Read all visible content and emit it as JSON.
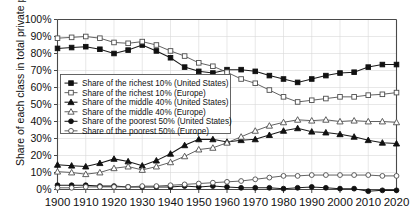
{
  "chart_data": {
    "type": "line",
    "title": "",
    "xlabel": "",
    "ylabel": "Share of each class in total private property",
    "xlim": [
      1900,
      2020
    ],
    "ylim": [
      0,
      1.0
    ],
    "ytick_labels": [
      "0%",
      "10%",
      "20%",
      "30%",
      "40%",
      "50%",
      "60%",
      "70%",
      "80%",
      "90%",
      "100%"
    ],
    "ytick_values": [
      0,
      10,
      20,
      30,
      40,
      50,
      60,
      70,
      80,
      90,
      100
    ],
    "xtick_labels": [
      "1900",
      "1910",
      "1920",
      "1930",
      "1940",
      "1950",
      "1960",
      "1970",
      "1980",
      "1990",
      "2000",
      "2010",
      "2020"
    ],
    "xtick_values": [
      1900,
      1910,
      1920,
      1930,
      1940,
      1950,
      1960,
      1970,
      1980,
      1990,
      2000,
      2010,
      2020
    ],
    "grid": true,
    "legend_position": "center-left",
    "x": [
      1900,
      1905,
      1910,
      1915,
      1920,
      1925,
      1930,
      1935,
      1940,
      1945,
      1950,
      1955,
      1960,
      1965,
      1970,
      1975,
      1980,
      1985,
      1990,
      1995,
      2000,
      2005,
      2010,
      2015,
      2020
    ],
    "series": [
      {
        "name": "Share of the richest 10% (United States)",
        "marker": "filled-square",
        "values": [
          83,
          83.5,
          84,
          82.5,
          80,
          82,
          85,
          81.5,
          77.5,
          72,
          69.5,
          68.5,
          70.5,
          70.5,
          69.5,
          67,
          65,
          63,
          65,
          67,
          68.5,
          69,
          72,
          73.5,
          73.5
        ]
      },
      {
        "name": "Share of the richest 10% (Europe)",
        "marker": "open-square",
        "values": [
          89,
          89.5,
          90,
          89,
          86.5,
          86,
          87,
          85,
          81.5,
          78.5,
          74.5,
          72.5,
          69,
          65,
          62.5,
          58.5,
          54.5,
          51.5,
          52.5,
          53.5,
          54.5,
          54.5,
          55.5,
          56,
          57
        ]
      },
      {
        "name": "Share of the middle 40% (United States)",
        "marker": "filled-triangle",
        "values": [
          14.5,
          14,
          13.5,
          15.5,
          18,
          16.5,
          14,
          17,
          21,
          26,
          29.5,
          29.5,
          28,
          29,
          29.5,
          32,
          34.5,
          36,
          34,
          33.5,
          32.5,
          31,
          29,
          27.5,
          27
        ]
      },
      {
        "name": "Share of the middle 40% (Europe)",
        "marker": "open-triangle",
        "values": [
          10.5,
          10,
          9,
          10,
          12.5,
          13.5,
          11.5,
          13.5,
          16,
          19.5,
          23.5,
          24.5,
          27.5,
          31,
          34.5,
          37.5,
          39.5,
          41,
          40.5,
          41,
          40,
          40.5,
          40,
          40,
          39.5
        ]
      },
      {
        "name": "Share of the poorest 50% (United States)",
        "marker": "filled-circle",
        "values": [
          2.5,
          2.5,
          2.5,
          2,
          2,
          1.5,
          1.5,
          1.5,
          1.5,
          2,
          1.5,
          2,
          1.5,
          1,
          1,
          1,
          0.5,
          1,
          1.5,
          1,
          0.5,
          0.5,
          -1,
          -0.5,
          -0.5
        ]
      },
      {
        "name": "Share of the poorest 50% (Europe)",
        "marker": "open-circle",
        "values": [
          1,
          1,
          1.5,
          1.5,
          1.5,
          1.5,
          2,
          2,
          2.5,
          3,
          3.5,
          4,
          4.5,
          5,
          6,
          7,
          8,
          8,
          8.5,
          8.5,
          8.5,
          8.5,
          8.5,
          8,
          8
        ]
      }
    ]
  }
}
